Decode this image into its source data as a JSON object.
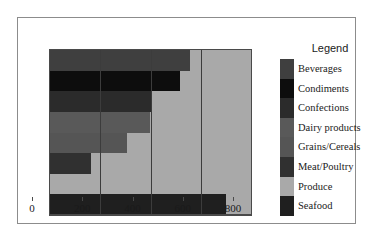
{
  "chart_data": {
    "type": "bar",
    "orientation": "horizontal",
    "title": "",
    "xlabel": "",
    "ylabel": "",
    "xlim": [
      0,
      800
    ],
    "xticks": [
      0,
      200,
      400,
      600,
      800
    ],
    "grid": true,
    "legend_title": "Legend",
    "legend_position": "right",
    "categories": [
      "Beverages",
      "Condiments",
      "Confections",
      "Dairy products",
      "Grains/Cereals",
      "Meat/Poultry",
      "Produce",
      "Seafood"
    ],
    "values": [
      557,
      518,
      402,
      397,
      307,
      163,
      80,
      700
    ],
    "colors": [
      "#3f3f3f",
      "#0d0d0d",
      "#2b2b2b",
      "#595959",
      "#555555",
      "#303030",
      "#a9a9a9",
      "#1f1f1f"
    ]
  },
  "axis": {
    "tick_labels": [
      "0",
      "200",
      "400",
      "600",
      "800"
    ]
  },
  "legend": {
    "title": "Legend",
    "items": [
      {
        "label": "Beverages",
        "color": "#3f3f3f"
      },
      {
        "label": "Condiments",
        "color": "#0d0d0d"
      },
      {
        "label": "Confections",
        "color": "#2b2b2b"
      },
      {
        "label": "Dairy products",
        "color": "#595959"
      },
      {
        "label": "Grains/Cereals",
        "color": "#555555"
      },
      {
        "label": "Meat/Poultry",
        "color": "#303030"
      },
      {
        "label": "Produce",
        "color": "#a9a9a9"
      },
      {
        "label": "Seafood",
        "color": "#1f1f1f"
      }
    ]
  },
  "style": {
    "plot_background": "#a9a9a9",
    "page_background": "#ffffff",
    "border_color": "#8c8c8c",
    "axis_color": "#4a4a4a",
    "text_color": "#1a1a1a"
  }
}
